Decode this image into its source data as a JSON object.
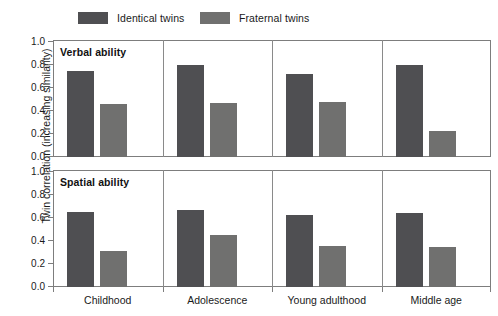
{
  "legend": {
    "items": [
      {
        "label": "Identical twins",
        "color": "#4f4f52",
        "name": "identical"
      },
      {
        "label": "Fraternal twins",
        "color": "#70706f",
        "name": "fraternal"
      }
    ]
  },
  "axes": {
    "y_title": "Twin correlation (increasing similarity)",
    "y_ticks": [
      "1.0",
      "0.8",
      "0.6",
      "0.4",
      "0.2",
      "0.0"
    ]
  },
  "panels": [
    {
      "title": "Verbal ability"
    },
    {
      "title": "Spatial ability"
    }
  ],
  "chart_data": {
    "type": "bar",
    "title": "",
    "xlabel": "",
    "ylabel": "Twin correlation (increasing similarity)",
    "ylim": [
      0.0,
      1.0
    ],
    "yticks": [
      0.0,
      0.2,
      0.4,
      0.6,
      0.8,
      1.0
    ],
    "grid": false,
    "legend_position": "top",
    "categories": [
      "Childhood",
      "Adolescence",
      "Young adulthood",
      "Middle age"
    ],
    "panels": [
      {
        "title": "Verbal ability",
        "series": [
          {
            "name": "Identical twins",
            "color": "#4f4f52",
            "values": [
              0.75,
              0.8,
              0.72,
              0.8
            ]
          },
          {
            "name": "Fraternal twins",
            "color": "#70706f",
            "values": [
              0.46,
              0.47,
              0.48,
              0.23
            ]
          }
        ]
      },
      {
        "title": "Spatial ability",
        "series": [
          {
            "name": "Identical twins",
            "color": "#4f4f52",
            "values": [
              0.65,
              0.67,
              0.63,
              0.64
            ]
          },
          {
            "name": "Fraternal twins",
            "color": "#70706f",
            "values": [
              0.31,
              0.455,
              0.36,
              0.35
            ]
          }
        ]
      }
    ]
  }
}
